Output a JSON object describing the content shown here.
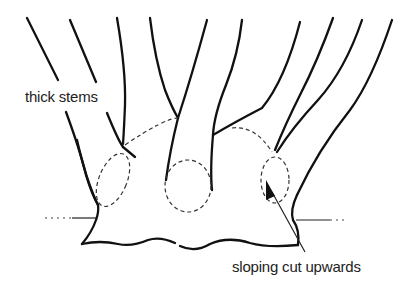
{
  "diagram": {
    "type": "plant-division-illustration",
    "labels": {
      "thick_stems": "thick stems",
      "sloping_cut": "sloping cut upwards"
    },
    "colors": {
      "line": "#111111",
      "text": "#222222",
      "background": "#ffffff"
    },
    "elements": [
      "stems",
      "crown-base",
      "dashed-cut-ovals",
      "soil-line",
      "arrow"
    ]
  }
}
